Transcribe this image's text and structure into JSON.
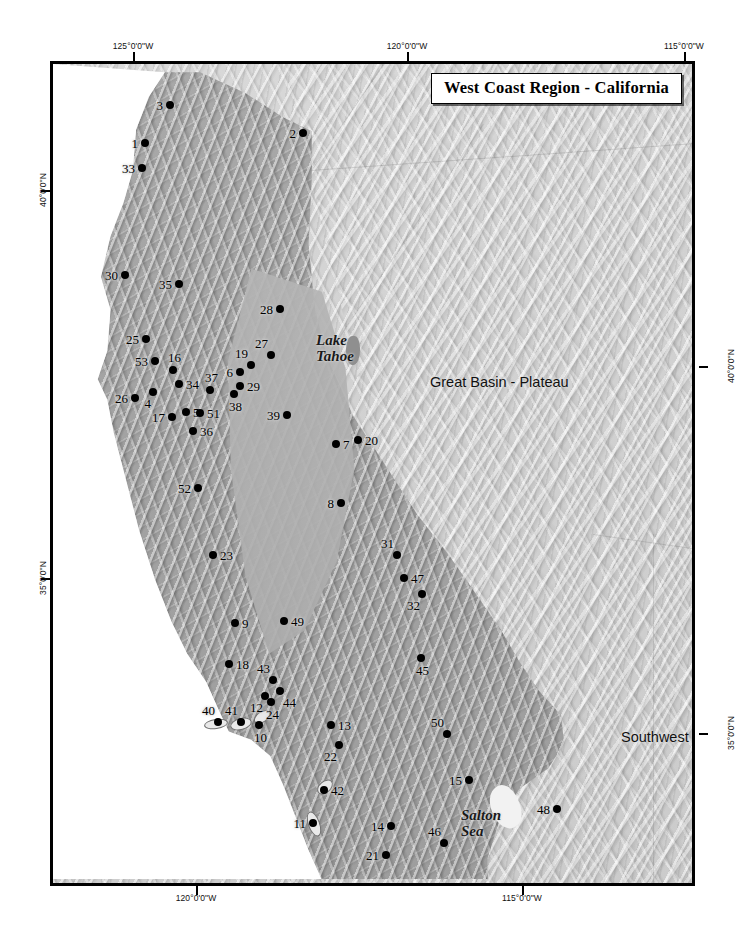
{
  "title_box": {
    "text": "West Coast Region - California"
  },
  "axes": {
    "top_labels": [
      {
        "text": "125°0'0\"W",
        "x": 133
      },
      {
        "text": "120°0'0\"W",
        "x": 407
      },
      {
        "text": "115°0'0\"W",
        "x": 684
      }
    ],
    "bottom_labels": [
      {
        "text": "120°0'0\"W",
        "x": 196
      },
      {
        "text": "115°0'0\"W",
        "x": 522
      }
    ],
    "left_labels": [
      {
        "text": "40°0'0\"N",
        "y": 190
      },
      {
        "text": "35°0'0\"N",
        "y": 578
      }
    ],
    "right_labels": [
      {
        "text": "40°0'0\"N",
        "y": 366
      },
      {
        "text": "35°0'0\"N",
        "y": 733
      }
    ]
  },
  "map_labels": [
    {
      "name": "lake-tahoe",
      "text": "Lake\nTahoe",
      "style": "serif-italic",
      "x": 313,
      "y": 330
    },
    {
      "name": "great-basin",
      "text": "Great Basin - Plateau",
      "style": "sans",
      "x": 427,
      "y": 371
    },
    {
      "name": "southwest",
      "text": "Southwest",
      "style": "sans",
      "x": 618,
      "y": 726
    },
    {
      "name": "salton-sea",
      "text": "Salton\nSea",
      "style": "serif-italic",
      "x": 458,
      "y": 805
    }
  ],
  "sites": [
    {
      "id": "1",
      "x": 142,
      "y": 140,
      "label_pos": "left"
    },
    {
      "id": "2",
      "x": 300,
      "y": 130,
      "label_pos": "left"
    },
    {
      "id": "3",
      "x": 167,
      "y": 102,
      "label_pos": "left"
    },
    {
      "id": "4",
      "x": 150,
      "y": 389,
      "label_pos": "below-left"
    },
    {
      "id": "5",
      "x": 183,
      "y": 409,
      "label_pos": "right"
    },
    {
      "id": "6",
      "x": 237,
      "y": 369,
      "label_pos": "left"
    },
    {
      "id": "7",
      "x": 333,
      "y": 441,
      "label_pos": "right"
    },
    {
      "id": "8",
      "x": 338,
      "y": 500,
      "label_pos": "left"
    },
    {
      "id": "9",
      "x": 232,
      "y": 620,
      "label_pos": "right"
    },
    {
      "id": "10",
      "x": 256,
      "y": 722,
      "label_pos": "below"
    },
    {
      "id": "11",
      "x": 310,
      "y": 820,
      "label_pos": "left"
    },
    {
      "id": "12",
      "x": 262,
      "y": 693,
      "label_pos": "below-left"
    },
    {
      "id": "13",
      "x": 328,
      "y": 722,
      "label_pos": "right"
    },
    {
      "id": "14",
      "x": 388,
      "y": 823,
      "label_pos": "left"
    },
    {
      "id": "15",
      "x": 466,
      "y": 777,
      "label_pos": "left"
    },
    {
      "id": "16",
      "x": 170,
      "y": 367,
      "label_pos": "above"
    },
    {
      "id": "17",
      "x": 169,
      "y": 414,
      "label_pos": "left"
    },
    {
      "id": "18",
      "x": 226,
      "y": 661,
      "label_pos": "right"
    },
    {
      "id": "19",
      "x": 248,
      "y": 362,
      "label_pos": "above-left"
    },
    {
      "id": "20",
      "x": 355,
      "y": 437,
      "label_pos": "right"
    },
    {
      "id": "21",
      "x": 383,
      "y": 852,
      "label_pos": "left"
    },
    {
      "id": "22",
      "x": 336,
      "y": 742,
      "label_pos": "below-left"
    },
    {
      "id": "23",
      "x": 210,
      "y": 552,
      "label_pos": "right"
    },
    {
      "id": "24",
      "x": 268,
      "y": 699,
      "label_pos": "below"
    },
    {
      "id": "25",
      "x": 143,
      "y": 336,
      "label_pos": "left"
    },
    {
      "id": "26",
      "x": 132,
      "y": 395,
      "label_pos": "left"
    },
    {
      "id": "27",
      "x": 268,
      "y": 352,
      "label_pos": "above-left"
    },
    {
      "id": "28",
      "x": 277,
      "y": 306,
      "label_pos": "left"
    },
    {
      "id": "29",
      "x": 237,
      "y": 383,
      "label_pos": "right"
    },
    {
      "id": "30",
      "x": 122,
      "y": 272,
      "label_pos": "left"
    },
    {
      "id": "31",
      "x": 394,
      "y": 552,
      "label_pos": "above-left"
    },
    {
      "id": "32",
      "x": 419,
      "y": 591,
      "label_pos": "below-left"
    },
    {
      "id": "33",
      "x": 139,
      "y": 165,
      "label_pos": "left"
    },
    {
      "id": "34",
      "x": 176,
      "y": 381,
      "label_pos": "right"
    },
    {
      "id": "35",
      "x": 176,
      "y": 281,
      "label_pos": "left"
    },
    {
      "id": "36",
      "x": 190,
      "y": 428,
      "label_pos": "right"
    },
    {
      "id": "37",
      "x": 207,
      "y": 387,
      "label_pos": "above"
    },
    {
      "id": "38",
      "x": 231,
      "y": 391,
      "label_pos": "below"
    },
    {
      "id": "39",
      "x": 284,
      "y": 412,
      "label_pos": "left"
    },
    {
      "id": "40",
      "x": 215,
      "y": 719,
      "label_pos": "above-left"
    },
    {
      "id": "41",
      "x": 238,
      "y": 719,
      "label_pos": "above-left"
    },
    {
      "id": "42",
      "x": 321,
      "y": 787,
      "label_pos": "right"
    },
    {
      "id": "43",
      "x": 270,
      "y": 677,
      "label_pos": "above-left"
    },
    {
      "id": "44",
      "x": 277,
      "y": 688,
      "label_pos": "below-right"
    },
    {
      "id": "45",
      "x": 418,
      "y": 655,
      "label_pos": "below"
    },
    {
      "id": "46",
      "x": 441,
      "y": 840,
      "label_pos": "above-left"
    },
    {
      "id": "47",
      "x": 401,
      "y": 575,
      "label_pos": "right"
    },
    {
      "id": "48",
      "x": 554,
      "y": 806,
      "label_pos": "left"
    },
    {
      "id": "49",
      "x": 281,
      "y": 618,
      "label_pos": "right"
    },
    {
      "id": "50",
      "x": 444,
      "y": 731,
      "label_pos": "above-left"
    },
    {
      "id": "51",
      "x": 197,
      "y": 410,
      "label_pos": "right"
    },
    {
      "id": "52",
      "x": 195,
      "y": 485,
      "label_pos": "left"
    },
    {
      "id": "53",
      "x": 152,
      "y": 358,
      "label_pos": "left"
    }
  ],
  "islands": [
    {
      "name": "island-san-miguel",
      "x": 213,
      "y": 721,
      "w": 22,
      "h": 8,
      "rot": -8
    },
    {
      "name": "island-santa-cruz",
      "x": 238,
      "y": 721,
      "w": 20,
      "h": 10,
      "rot": -15
    },
    {
      "name": "island-santa-catalina",
      "x": 259,
      "y": 714,
      "w": 16,
      "h": 9,
      "rot": -35
    },
    {
      "name": "island-san-nicolas",
      "x": 322,
      "y": 784,
      "w": 16,
      "h": 10,
      "rot": -40
    },
    {
      "name": "island-san-clemente",
      "x": 311,
      "y": 821,
      "w": 10,
      "h": 24,
      "rot": -20
    }
  ]
}
